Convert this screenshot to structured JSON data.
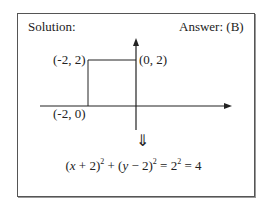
{
  "header": {
    "left_label": "Solution:",
    "right_label": "Answer: (B)"
  },
  "diagram": {
    "points": [
      {
        "label": "(-2, 2)",
        "x": -2,
        "y": 2
      },
      {
        "label": "(0, 2)",
        "x": 0,
        "y": 2
      },
      {
        "label": "(-2, 0)",
        "x": -2,
        "y": 0
      }
    ],
    "arrow_symbol": "⇓"
  },
  "equation": {
    "text": "(x + 2)^2 + (y − 2)^2 = 2^2 = 4",
    "parts": {
      "p1": "(",
      "x": "x",
      "p2": " + 2)",
      "e1": "2",
      "p3": " + (",
      "y": "y",
      "p4": " − 2)",
      "e2": "2",
      "p5": " = 2",
      "e3": "2",
      "p6": " = 4"
    }
  }
}
